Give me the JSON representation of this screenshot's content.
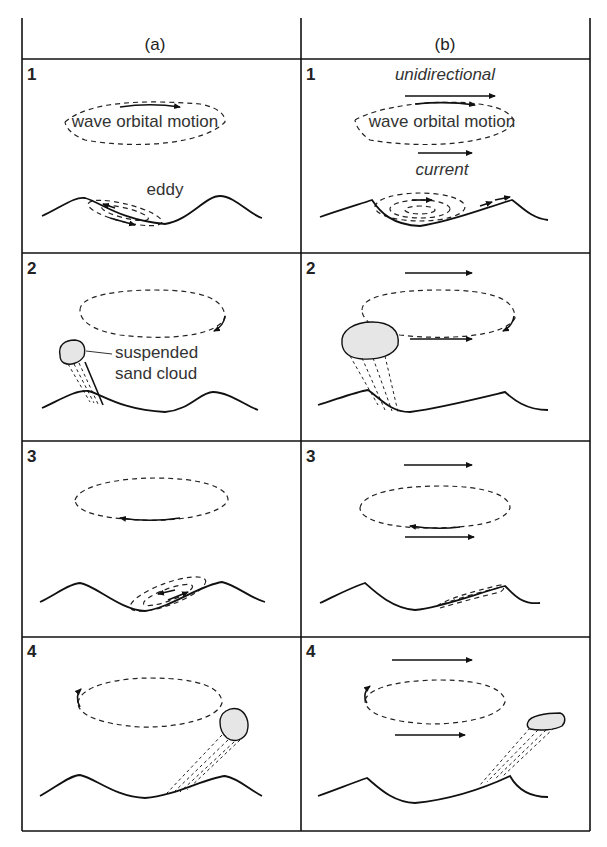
{
  "figure": {
    "columns": [
      {
        "id": "a",
        "label": "(a)"
      },
      {
        "id": "b",
        "label": "(b)"
      }
    ],
    "rows": [
      {
        "step": "1"
      },
      {
        "step": "2"
      },
      {
        "step": "3"
      },
      {
        "step": "4"
      }
    ],
    "annotations": {
      "wave_orbital_motion": "wave orbital motion",
      "eddy": "eddy",
      "suspended_line1": "suspended",
      "suspended_line2": "sand cloud",
      "unidirectional": "unidirectional",
      "current": "current"
    },
    "colors": {
      "line": "#111111",
      "background": "#ffffff",
      "sand_cloud": "#e6e6e6"
    }
  }
}
